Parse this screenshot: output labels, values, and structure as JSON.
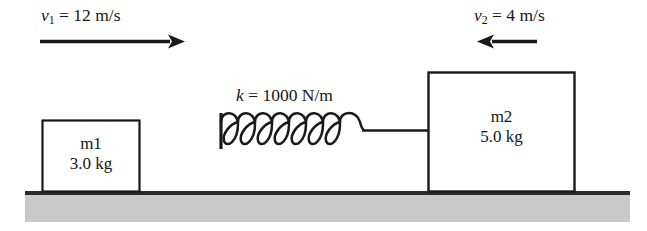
{
  "figure": {
    "name": "two-block-spring-collision-diagram",
    "type": "physics-mechanics-diagram",
    "background_color": "#ffffff",
    "ink_color": "#1a1a1a",
    "ground_fill_color": "#c8c8c8",
    "ground_line_color": "#2b2b2b"
  },
  "velocity_left": {
    "symbol": "v",
    "subscript": "1",
    "equals": "=",
    "value": "12",
    "units": "m/s",
    "full_text": "v1 = 12 m/s",
    "arrow_direction": "right",
    "arrow_name": "velocity-arrow-right"
  },
  "velocity_right": {
    "symbol": "v",
    "subscript": "2",
    "equals": "=",
    "value": "4",
    "units": "m/s",
    "full_text": "v2 = 4 m/s",
    "arrow_direction": "left",
    "arrow_name": "velocity-arrow-left"
  },
  "spring": {
    "symbol": "k",
    "equals": "=",
    "value": "1000",
    "units": "N/m",
    "full_text": "k = 1000 N/m",
    "coil_count": 7,
    "anchor": "vertical-plate-left",
    "connector": "straight-rod-to-block-2"
  },
  "block_1": {
    "symbol": "m",
    "subscript": "1",
    "mass_value": "3.0",
    "mass_units": "kg",
    "mass_text": "3.0 kg"
  },
  "block_2": {
    "symbol": "m",
    "subscript": "2",
    "mass_value": "5.0",
    "mass_units": "kg",
    "mass_text": "5.0 kg"
  },
  "ground": {
    "label": "ground-surface"
  }
}
